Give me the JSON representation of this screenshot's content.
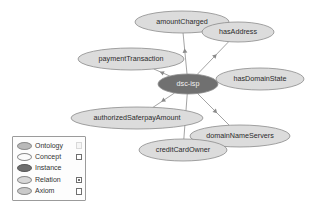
{
  "diagram": {
    "type": "ontology-graph",
    "center_node": {
      "id": "dsc-isp",
      "label": "dsc-isp",
      "kind": "instance"
    },
    "nodes": [
      {
        "id": "amountCharged",
        "label": "amountCharged",
        "kind": "relation",
        "cx": 182,
        "cy": 22,
        "rx": 47,
        "ry": 11
      },
      {
        "id": "hasAddress",
        "label": "hasAddress",
        "kind": "relation",
        "cx": 238,
        "cy": 32,
        "rx": 36,
        "ry": 10
      },
      {
        "id": "paymentTransaction",
        "label": "paymentTransaction",
        "kind": "relation",
        "cx": 131,
        "cy": 59,
        "rx": 53,
        "ry": 11
      },
      {
        "id": "dsc-isp",
        "label": "dsc-isp",
        "kind": "instance",
        "cx": 188,
        "cy": 84,
        "rx": 30,
        "ry": 10
      },
      {
        "id": "hasDomainState",
        "label": "hasDomainState",
        "kind": "relation",
        "cx": 260,
        "cy": 79,
        "rx": 44,
        "ry": 11
      },
      {
        "id": "authorizedSaferpayAmount",
        "label": "authorizedSaferpayAmount",
        "kind": "relation",
        "cx": 137,
        "cy": 118,
        "rx": 66,
        "ry": 11
      },
      {
        "id": "domainNameServers",
        "label": "domainNameServers",
        "kind": "relation",
        "cx": 240,
        "cy": 136,
        "rx": 50,
        "ry": 11
      },
      {
        "id": "creditCardOwner",
        "label": "creditCardOwner",
        "kind": "relation",
        "cx": 183,
        "cy": 150,
        "rx": 44,
        "ry": 11
      }
    ],
    "edges": [
      {
        "from": "dsc-isp",
        "to": "amountCharged",
        "directed": true
      },
      {
        "from": "dsc-isp",
        "to": "hasAddress",
        "directed": true
      },
      {
        "from": "dsc-isp",
        "to": "paymentTransaction",
        "directed": true
      },
      {
        "from": "dsc-isp",
        "to": "hasDomainState",
        "directed": true
      },
      {
        "from": "dsc-isp",
        "to": "authorizedSaferpayAmount",
        "directed": true
      },
      {
        "from": "dsc-isp",
        "to": "domainNameServers",
        "directed": true
      },
      {
        "from": "dsc-isp",
        "to": "creditCardOwner",
        "directed": true
      }
    ]
  },
  "legend": {
    "items": [
      {
        "label": "Ontology",
        "swatch": "ontology",
        "checkbox": "faint",
        "checked": false
      },
      {
        "label": "Concept",
        "swatch": "concept",
        "checkbox": "normal",
        "checked": false
      },
      {
        "label": "Instance",
        "swatch": "instance",
        "checkbox": "hidden",
        "checked": false
      },
      {
        "label": "Relation",
        "swatch": "relation",
        "checkbox": "normal",
        "checked": true
      },
      {
        "label": "Axiom",
        "swatch": "axiom",
        "checkbox": "normal",
        "checked": false
      }
    ]
  },
  "colors": {
    "node_fill": "#dcdcdc",
    "node_stroke": "#8c8c8c",
    "instance_fill": "#707070",
    "edge": "#9a9a9a",
    "background": "#ffffff"
  }
}
